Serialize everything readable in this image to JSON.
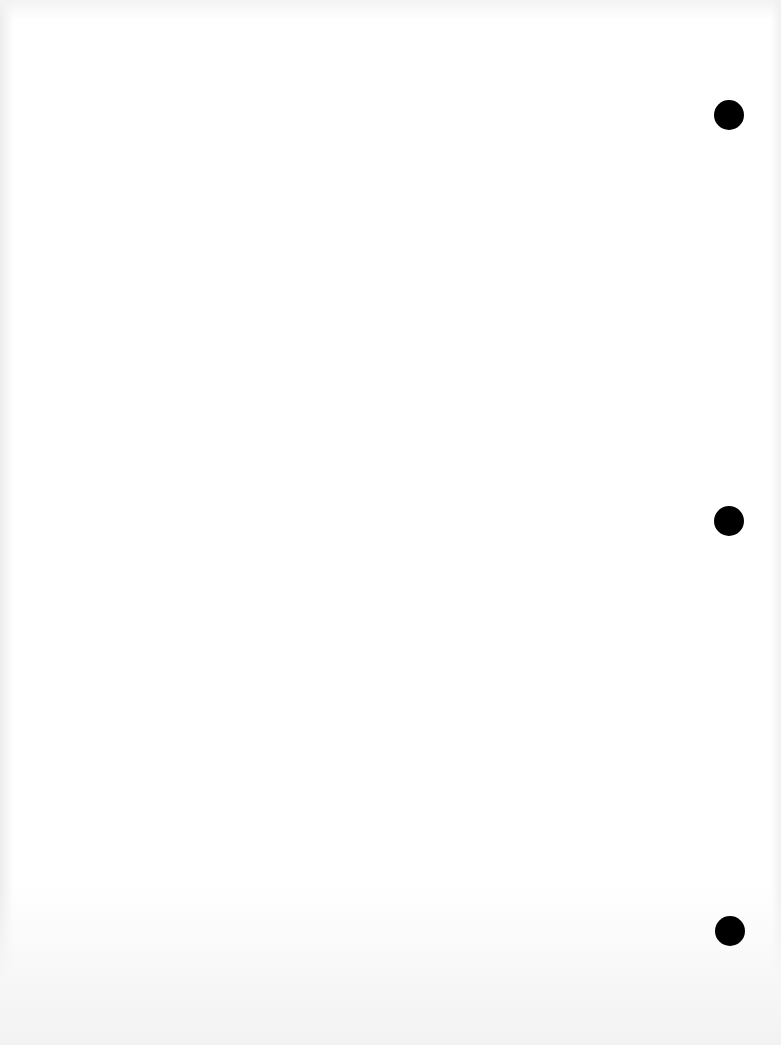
{
  "document": {
    "type": "blank scanned page",
    "text_content": "",
    "page_color": "#ffffff",
    "punch_holes": {
      "count": 3,
      "color": "#000000",
      "diameter_px": 30,
      "positions": [
        {
          "x": 729,
          "y": 115
        },
        {
          "x": 729,
          "y": 521
        },
        {
          "x": 730,
          "y": 931
        }
      ]
    }
  }
}
